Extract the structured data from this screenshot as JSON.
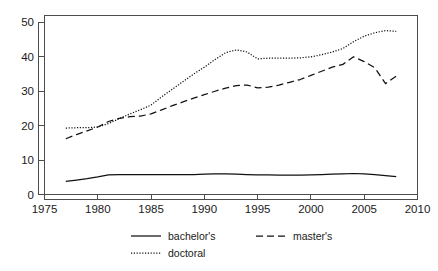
{
  "chart_data": {
    "type": "line",
    "title": "",
    "subtitle": "",
    "xlabel": "",
    "ylabel": "",
    "xlim": [
      1975,
      2010
    ],
    "ylim": [
      0,
      52
    ],
    "grid": false,
    "legend_position": "bottom",
    "x_ticks": [
      "1975",
      "1980",
      "1985",
      "1990",
      "1995",
      "2000",
      "2005",
      "2010"
    ],
    "y_ticks": [
      "0",
      "10",
      "20",
      "30",
      "40",
      "50"
    ],
    "x": [
      1977,
      1978,
      1979,
      1980,
      1981,
      1982,
      1983,
      1984,
      1985,
      1986,
      1987,
      1988,
      1989,
      1990,
      1991,
      1992,
      1993,
      1994,
      1995,
      1996,
      1997,
      1998,
      1999,
      2000,
      2001,
      2002,
      2003,
      2004,
      2005,
      2006,
      2007,
      2008
    ],
    "series": [
      {
        "name": "bachelor's",
        "style": "solid",
        "values": [
          3.8,
          4.2,
          4.6,
          5.1,
          5.7,
          5.8,
          5.8,
          5.8,
          5.8,
          5.8,
          5.8,
          5.8,
          5.8,
          5.9,
          6.0,
          6.0,
          5.9,
          5.8,
          5.7,
          5.7,
          5.6,
          5.6,
          5.6,
          5.7,
          5.8,
          5.9,
          6.0,
          6.1,
          6.0,
          5.8,
          5.5,
          5.2
        ]
      },
      {
        "name": "master's",
        "style": "dashed",
        "values": [
          16.2,
          17.4,
          18.5,
          19.6,
          21.2,
          22.1,
          22.6,
          22.8,
          23.4,
          24.6,
          25.8,
          26.9,
          28.0,
          29.0,
          30.0,
          30.9,
          31.6,
          31.8,
          31.0,
          31.2,
          31.8,
          32.6,
          33.4,
          34.6,
          35.8,
          37.0,
          37.8,
          40.0,
          38.6,
          36.8,
          32.2,
          34.4
        ]
      },
      {
        "name": "doctoral",
        "style": "dotted",
        "values": [
          19.3,
          19.4,
          19.4,
          19.6,
          20.6,
          22.0,
          23.4,
          24.6,
          26.0,
          28.4,
          30.6,
          32.8,
          35.0,
          37.0,
          39.2,
          41.2,
          42.0,
          41.4,
          39.4,
          39.6,
          39.6,
          39.6,
          39.7,
          40.0,
          40.6,
          41.4,
          42.4,
          44.4,
          46.0,
          47.0,
          47.6,
          47.4
        ]
      }
    ],
    "legend": [
      {
        "label": "bachelor's",
        "style": "solid"
      },
      {
        "label": "master's",
        "style": "dashed"
      },
      {
        "label": "doctoral",
        "style": "dotted"
      }
    ]
  }
}
